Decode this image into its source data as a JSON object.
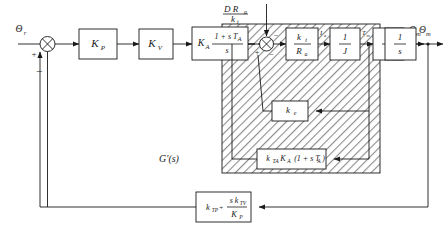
{
  "diagram": {
    "subsystem_label": "G'(s)",
    "signals": {
      "input": "Θ",
      "input_sub": "r",
      "output": "Θ",
      "output_sub": "m",
      "torque_disturbance_num": "D R",
      "torque_disturbance_num_sub": "a",
      "torque_disturbance_den": "k",
      "torque_disturbance_den_sub": "t",
      "inner_label_1": "I",
      "inner_label_1_sub": "a",
      "inner_label_2": "T",
      "inner_label_2_sub": "m",
      "inner_label_3": "ω",
      "inner_label_3_sub": "m"
    },
    "signs": {
      "sum1_plus": "+",
      "sum1_minus": "−",
      "sum2_plus": "+",
      "sum2_minus1": "−",
      "sum2_minus2": "−"
    },
    "blocks": [
      {
        "id": "kp",
        "label": "K",
        "sub": "P",
        "kind": "simple"
      },
      {
        "id": "kv",
        "label": "K",
        "sub": "V",
        "kind": "simple"
      },
      {
        "id": "ka",
        "label": "K",
        "sub": "A",
        "num": "1 + s T",
        "num_sub": "A",
        "den": "s",
        "kind": "gain-fraction"
      },
      {
        "id": "ktra",
        "num": "k",
        "num_sub": "t",
        "den": "R",
        "den_sub": "a",
        "kind": "fraction"
      },
      {
        "id": "invj",
        "num": "1",
        "den": "J",
        "kind": "fraction"
      },
      {
        "id": "ints1",
        "num": "1",
        "den": "s",
        "kind": "fraction"
      },
      {
        "id": "ints2",
        "num": "1",
        "den": "s",
        "kind": "fraction"
      },
      {
        "id": "ke",
        "label": "k",
        "sub": "e",
        "kind": "simple"
      },
      {
        "id": "ktaka",
        "label": "k",
        "sub": "TA",
        "label2": "K",
        "sub2": "A",
        "tail": "(1 + s T",
        "tail_sub": "A",
        "tail_end": ")",
        "kind": "product"
      },
      {
        "id": "ktp",
        "label": "k",
        "sub": "TP",
        "plus": "+",
        "num": "s k",
        "num_sub": "TV",
        "den": "K",
        "den_sub": "P",
        "kind": "sum-fraction"
      }
    ],
    "colors": {
      "line": "#1a1a1a",
      "fill": "#ffffff",
      "hatch": "#9a9a9a"
    }
  }
}
